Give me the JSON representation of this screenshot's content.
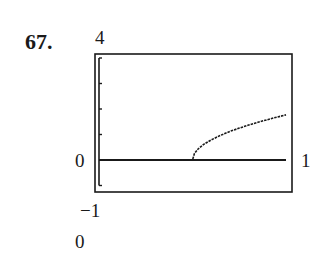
{
  "problem_number": "67.",
  "labels": {
    "ymax": "4",
    "ymin": "−1",
    "xmin": "0",
    "xmax": "1",
    "bottom": "0"
  },
  "colors": {
    "ink": "#1a1a1a",
    "background": "#ffffff"
  },
  "chart_data": {
    "type": "line",
    "title": "",
    "xlabel": "",
    "ylabel": "",
    "xlim": [
      0,
      1
    ],
    "ylim": [
      -1,
      4
    ],
    "window_labels": {
      "ymax": "4",
      "ymin": "-1",
      "xmin": "0",
      "xmax": "1",
      "yscale_note": "0"
    },
    "y_ticks": [
      0,
      1,
      2,
      3,
      4
    ],
    "grid": false,
    "series": [
      {
        "name": "f(x)",
        "x": [
          0.0,
          0.1,
          0.2,
          0.3,
          0.4,
          0.5,
          0.51,
          0.53,
          0.56,
          0.6,
          0.65,
          0.7,
          0.75,
          0.8,
          0.85,
          0.9,
          0.95,
          1.0
        ],
        "y": [
          0,
          0,
          0,
          0,
          0,
          0,
          0.25,
          0.43,
          0.61,
          0.79,
          0.97,
          1.12,
          1.25,
          1.37,
          1.48,
          1.58,
          1.68,
          1.77
        ]
      }
    ]
  }
}
